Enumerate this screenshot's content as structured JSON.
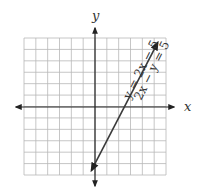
{
  "chart_data": {
    "type": "line",
    "title": "",
    "xlabel": "x",
    "ylabel": "y",
    "xlim": [
      -6,
      6
    ],
    "ylim": [
      -6,
      6
    ],
    "grid": true,
    "tick_labels": false,
    "series": [
      {
        "name": "y = 2x − 5",
        "alt_name": "2x − y = 5",
        "slope": 2,
        "intercept": -5,
        "x": [
          -0.3,
          5.3
        ],
        "y": [
          -5.6,
          5.6
        ],
        "arrows": "both"
      }
    ],
    "annotations": [
      {
        "text": "y = 2x − 5",
        "rotated": true
      },
      {
        "text": "2x − y = 5",
        "rotated": true
      }
    ],
    "colors": {
      "line": "#3a3a3a",
      "grid": "#b8b8b8",
      "axis": "#222222"
    }
  },
  "labels": {
    "x_axis": "x",
    "y_axis": "y",
    "eq1": "y = 2x − 5",
    "eq2": "2x − y = 5"
  }
}
